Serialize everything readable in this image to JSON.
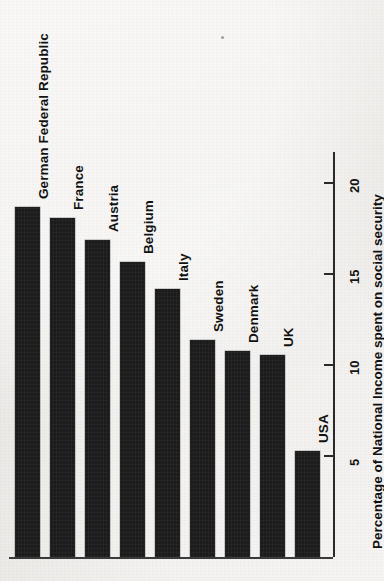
{
  "figure": {
    "orientation": "rotated-90",
    "background_color": "#ebe9e6",
    "ink_color": "#1b1b1b"
  },
  "chart_data": {
    "type": "bar",
    "title": "",
    "xlabel": "",
    "ylabel": "Percentage of National Income spent on social security",
    "categories": [
      "German Federal Republic",
      "France",
      "Austria",
      "Belgium",
      "Italy",
      "Sweden",
      "Denmark",
      "UK",
      "USA"
    ],
    "values": [
      18.6,
      18.0,
      16.8,
      15.6,
      14.1,
      11.3,
      10.7,
      10.5,
      5.2
    ],
    "tick_values": [
      5,
      10,
      15,
      20
    ],
    "tick_labels": [
      "5",
      "10",
      "15",
      "20"
    ],
    "ylim": [
      0,
      21.5
    ],
    "grid": false,
    "legend": null
  },
  "axis": {
    "title": "Percentage of National Income spent on social security",
    "ticks": [
      {
        "label": "5",
        "value": 5
      },
      {
        "label": "10",
        "value": 10
      },
      {
        "label": "15",
        "value": 15
      },
      {
        "label": "20",
        "value": 20
      }
    ]
  },
  "bars": [
    {
      "label": "German Federal Republic",
      "value": 18.6
    },
    {
      "label": "France",
      "value": 18.0
    },
    {
      "label": "Austria",
      "value": 16.8
    },
    {
      "label": "Belgium",
      "value": 15.6
    },
    {
      "label": "Italy",
      "value": 14.1
    },
    {
      "label": "Sweden",
      "value": 11.3
    },
    {
      "label": "Denmark",
      "value": 10.7
    },
    {
      "label": "UK",
      "value": 10.5
    },
    {
      "label": "USA",
      "value": 5.2
    }
  ]
}
